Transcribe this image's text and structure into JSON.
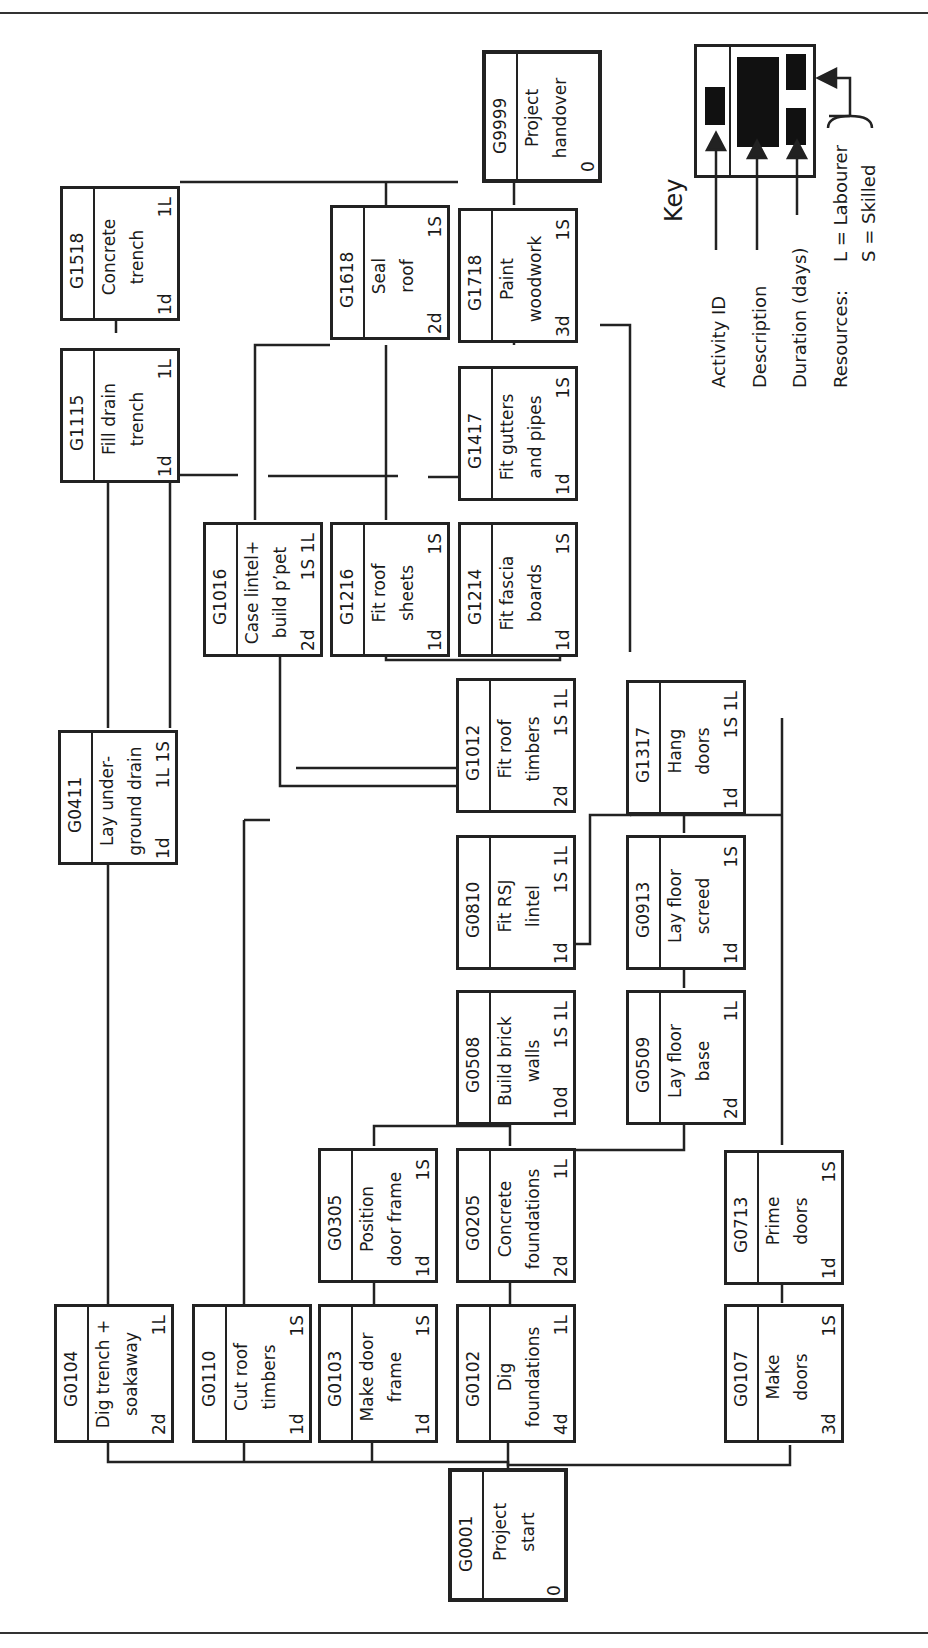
{
  "diagram": {
    "type": "precedence-network",
    "orientation": "rotated-90-ccw",
    "key": {
      "title": "Key",
      "labels": {
        "activity_id": "Activity ID",
        "description": "Description",
        "duration": "Duration (days)",
        "resources": "Resources:",
        "labourer": "L = Labourer",
        "skilled": "S = Skilled"
      }
    },
    "nodes": [
      {
        "id": "G0001",
        "desc": [
          "Project",
          "start"
        ],
        "duration": "0",
        "resources": ""
      },
      {
        "id": "G0104",
        "desc": [
          "Dig trench +",
          "soakaway"
        ],
        "duration": "2d",
        "resources": "1L"
      },
      {
        "id": "G0110",
        "desc": [
          "Cut roof",
          "timbers"
        ],
        "duration": "1d",
        "resources": "1S"
      },
      {
        "id": "G0103",
        "desc": [
          "Make door",
          "frame"
        ],
        "duration": "1d",
        "resources": "1S"
      },
      {
        "id": "G0102",
        "desc": [
          "Dig",
          "foundations"
        ],
        "duration": "4d",
        "resources": "1L"
      },
      {
        "id": "G0107",
        "desc": [
          "Make",
          "doors"
        ],
        "duration": "3d",
        "resources": "1S"
      },
      {
        "id": "G0305",
        "desc": [
          "Position",
          "door frame"
        ],
        "duration": "1d",
        "resources": "1S"
      },
      {
        "id": "G0205",
        "desc": [
          "Concrete",
          "foundations"
        ],
        "duration": "2d",
        "resources": "1L"
      },
      {
        "id": "G0713",
        "desc": [
          "Prime",
          "doors"
        ],
        "duration": "1d",
        "resources": "1S"
      },
      {
        "id": "G0508",
        "desc": [
          "Build brick",
          "walls"
        ],
        "duration": "10d",
        "resources": "1S 1L"
      },
      {
        "id": "G0509",
        "desc": [
          "Lay floor",
          "base"
        ],
        "duration": "2d",
        "resources": "1L"
      },
      {
        "id": "G0411",
        "desc": [
          "Lay under-",
          "ground drain"
        ],
        "duration": "1d",
        "resources": "1L 1S"
      },
      {
        "id": "G0810",
        "desc": [
          "Fit RSJ",
          "lintel"
        ],
        "duration": "1d",
        "resources": "1S 1L"
      },
      {
        "id": "G0913",
        "desc": [
          "Lay floor",
          "screed"
        ],
        "duration": "1d",
        "resources": "1S"
      },
      {
        "id": "G1012",
        "desc": [
          "Fit roof",
          "timbers"
        ],
        "duration": "2d",
        "resources": "1S 1L"
      },
      {
        "id": "G1317",
        "desc": [
          "Hang",
          "doors"
        ],
        "duration": "1d",
        "resources": "1S 1L"
      },
      {
        "id": "G1016",
        "desc": [
          "Case lintel+",
          "build p’pet"
        ],
        "duration": "2d",
        "resources": "1S 1L"
      },
      {
        "id": "G1216",
        "desc": [
          "Fit roof",
          "sheets"
        ],
        "duration": "1d",
        "resources": "1S"
      },
      {
        "id": "G1214",
        "desc": [
          "Fit fascia",
          "boards"
        ],
        "duration": "1d",
        "resources": "1S"
      },
      {
        "id": "G1115",
        "desc": [
          "Fill drain",
          "trench"
        ],
        "duration": "1d",
        "resources": "1L"
      },
      {
        "id": "G1417",
        "desc": [
          "Fit gutters",
          "and pipes"
        ],
        "duration": "1d",
        "resources": "1S"
      },
      {
        "id": "G1518",
        "desc": [
          "Concrete",
          "trench"
        ],
        "duration": "1d",
        "resources": "1L"
      },
      {
        "id": "G1618",
        "desc": [
          "Seal",
          "roof"
        ],
        "duration": "2d",
        "resources": "1S"
      },
      {
        "id": "G1718",
        "desc": [
          "Paint",
          "woodwork"
        ],
        "duration": "3d",
        "resources": "1S"
      },
      {
        "id": "G9999",
        "desc": [
          "Project",
          "handover"
        ],
        "duration": "0",
        "resources": ""
      }
    ]
  }
}
